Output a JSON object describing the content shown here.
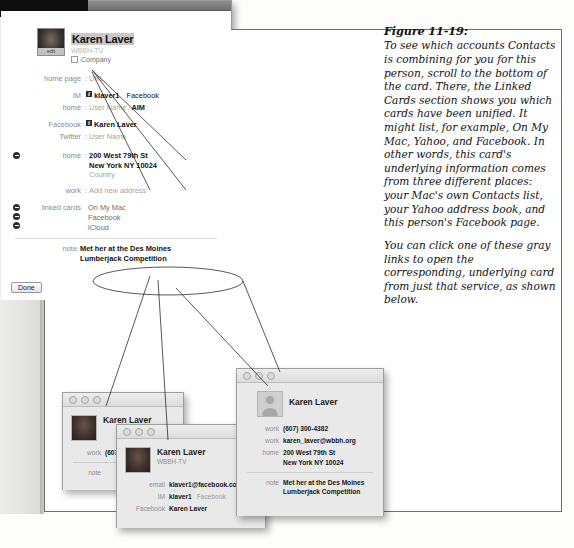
{
  "callout": {
    "line1": "Facebook data",
    "line2": "(\"f\" logo)"
  },
  "caption": {
    "figure_number": "Figure 11-19:",
    "paragraph1": "To see which accounts Contacts is combining for you for this person, scroll to the bottom of the card. There, the Linked Cards section shows you which cards have been unified. It might list, for example, On My Mac, Yahoo, and Facebook. In other words, this card's underlying information comes from three different places: your Mac's own Contacts list, your Yahoo address book, and this person's Facebook page.",
    "paragraph2": "You can click one of these gray links to open the corresponding, underlying card from just that service, as shown below."
  },
  "main_card": {
    "avatar_edit_label": "edit",
    "name": "Karen Laver",
    "organization": "WBBH-TV",
    "company_checkbox_label": "Company",
    "rows": {
      "home_page_label": "home page",
      "home_page_value": "URL",
      "im_label": "IM",
      "im_value": "klaver1",
      "im_service": "Facebook",
      "home_im_label": "home",
      "home_im_value": "User Name",
      "home_im_service": "AIM",
      "facebook_label": "Facebook",
      "facebook_value": "Karen Laver",
      "twitter_label": "Twitter",
      "twitter_value": "User Name",
      "address_label": "home",
      "address_line1": "200 West 79th St",
      "address_line2": "New York NY  10024",
      "address_line3": "Country",
      "work_address_label": "work",
      "work_address_value": "Add new address",
      "linked_cards_label": "linked cards",
      "linked_card_1": "On My Mac",
      "linked_card_2": "Facebook",
      "linked_card_3": "iCloud",
      "note_label": "note",
      "note_line1": "Met her at the Des Moines",
      "note_line2": "Lumberjack Competition"
    },
    "done_label": "Done",
    "fb_badge_glyph": "f"
  },
  "card_on_my_mac": {
    "name": "Karen Laver",
    "work_label": "work",
    "work_value": "(607) 300-4…",
    "note_label": "note"
  },
  "card_facebook": {
    "name": "Karen Laver",
    "organization": "WBBH-TV",
    "email_label": "email",
    "email_value": "klaver1@facebook.com",
    "im_label": "IM",
    "im_value": "klaver1",
    "im_service": "Facebook",
    "facebook_label": "Facebook",
    "facebook_value": "Karen Laver"
  },
  "card_icloud": {
    "name": "Karen Laver",
    "work_phone_label": "work",
    "work_phone_value": "(607) 300-4382",
    "work_email_label": "work",
    "work_email_value": "karen_laver@wbbh.org",
    "home_label": "home",
    "home_line1": "200 West 79th St",
    "home_line2": "New York NY  10024",
    "note_label": "note",
    "note_line1": "Met her at the Des Moines",
    "note_line2": "Lumberjack Competition"
  }
}
